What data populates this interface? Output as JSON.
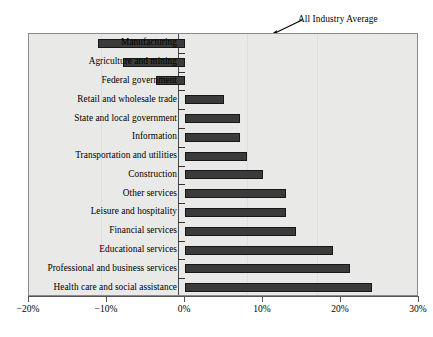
{
  "chart_data": {
    "type": "bar",
    "orientation": "horizontal",
    "title": "",
    "xlabel": "",
    "ylabel": "",
    "xlim": [
      -20,
      30
    ],
    "xticks": [
      -20,
      -10,
      0,
      10,
      20,
      30
    ],
    "xtick_labels": [
      "−20%",
      "−10%",
      "0%",
      "10%",
      "20%",
      "30%"
    ],
    "grid": false,
    "legend": false,
    "annotations": [
      {
        "text": "All Industry Average",
        "points_to": "zero-axis-top",
        "arrow": true
      }
    ],
    "categories": [
      "Manufacturing",
      "Agriculture and mining",
      "Federal government",
      "Retail and wholesale trade",
      "State and local government",
      "Information",
      "Transportation and utilities",
      "Construction",
      "Other services",
      "Leisure and hospitality",
      "Financial services",
      "Educational services",
      "Professional and business services",
      "Health care and social assistance"
    ],
    "values": [
      -11.2,
      -8.0,
      -3.7,
      5.0,
      7.0,
      7.0,
      8.0,
      10.0,
      13.0,
      13.0,
      14.2,
      19.0,
      21.2,
      24.0
    ],
    "value_labels": [
      "−11.2%",
      "−8.0%",
      "−3.7%",
      "5.0%",
      "7.0%",
      "7.0%",
      "8.0%",
      "10.0%",
      "13.0%",
      "13.0%",
      "14.2%",
      "19.0%",
      "21.2%",
      "24.0%"
    ],
    "bar_color": "#3b3b3b",
    "bar_edge_color": "#171717",
    "plot_background": "#e9e9e7",
    "figure_background": "#ffffff"
  }
}
